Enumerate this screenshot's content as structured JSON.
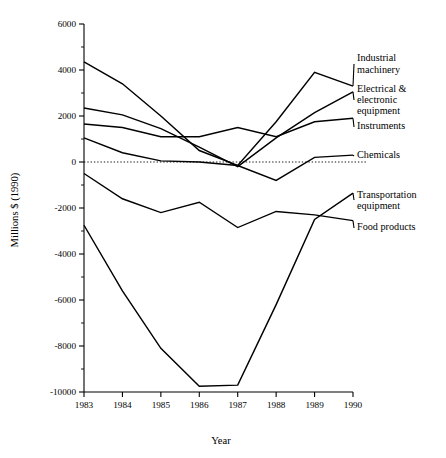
{
  "chart_data": {
    "type": "line",
    "title": "",
    "xlabel": "Year",
    "ylabel": "Millions $ (1990)",
    "x": [
      1983,
      1984,
      1985,
      1986,
      1987,
      1988,
      1989,
      1990
    ],
    "xtick_labels": [
      "1983",
      "1984",
      "1985",
      "1986",
      "1987",
      "1988",
      "1989",
      "1990"
    ],
    "ytick_labels": [
      "6000",
      "4000",
      "2000",
      "0",
      "-2000",
      "-4000",
      "-6000",
      "-8000",
      "-10000"
    ],
    "ytick_values": [
      6000,
      4000,
      2000,
      0,
      -2000,
      -4000,
      -6000,
      -8000,
      -10000
    ],
    "yminor_step": 1000,
    "xlim": [
      1983,
      1990
    ],
    "ylim": [
      -10000,
      6000
    ],
    "grid": false,
    "zero_reference_line": true,
    "legend_position": "right-inline-labels",
    "series": [
      {
        "name": "Industrial machinery",
        "values": [
          4350,
          3400,
          2000,
          500,
          -150,
          1750,
          3900,
          3300
        ]
      },
      {
        "name": "Electrical & electronic equipment",
        "values": [
          2350,
          2050,
          1450,
          650,
          -200,
          1050,
          2150,
          3050
        ]
      },
      {
        "name": "Instruments",
        "values": [
          1650,
          1500,
          1100,
          1100,
          1500,
          1100,
          1750,
          1900
        ]
      },
      {
        "name": "Chemicals",
        "values": [
          1050,
          400,
          50,
          0,
          -150,
          -800,
          200,
          300
        ]
      },
      {
        "name": "Food products",
        "values": [
          -500,
          -1600,
          -2200,
          -1750,
          -2850,
          -2150,
          -2300,
          -2550
        ]
      },
      {
        "name": "Transportation equipment",
        "values": [
          -2750,
          -5600,
          -8100,
          -9750,
          -9700,
          -6200,
          -2500,
          -1350
        ]
      }
    ]
  },
  "legend": {
    "entries": [
      {
        "label_lines": [
          "Industrial",
          "machinery"
        ],
        "series": "Industrial machinery"
      },
      {
        "label_lines": [
          "Electrical &",
          "electronic",
          "equipment"
        ],
        "series": "Electrical & electronic equipment"
      },
      {
        "label_lines": [
          "Instruments"
        ],
        "series": "Instruments"
      },
      {
        "label_lines": [
          "Chemicals"
        ],
        "series": "Chemicals"
      },
      {
        "label_lines": [
          "Transportation",
          "equipment"
        ],
        "series": "Transportation equipment"
      },
      {
        "label_lines": [
          "Food products"
        ],
        "series": "Food products"
      }
    ]
  },
  "labels": {
    "legend_industrial_1": "Industrial",
    "legend_industrial_2": "machinery",
    "legend_electrical_1": "Electrical &",
    "legend_electrical_2": "electronic",
    "legend_electrical_3": "equipment",
    "legend_instruments": "Instruments",
    "legend_chemicals": "Chemicals",
    "legend_transportation_1": "Transportation",
    "legend_transportation_2": "equipment",
    "legend_food": "Food products"
  },
  "colors": {
    "line": "#000000",
    "axis": "#000000",
    "background": "#ffffff"
  }
}
